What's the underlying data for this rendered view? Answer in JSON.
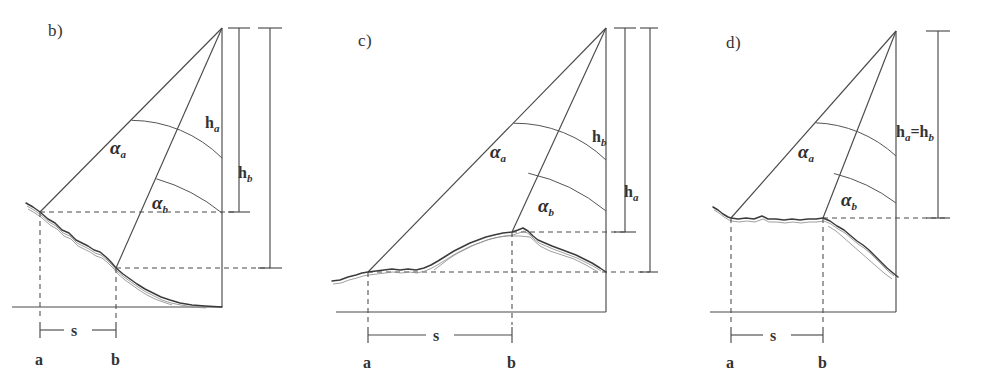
{
  "figure": {
    "background_color": "#ffffff",
    "ink_color": "#4a4a4a",
    "terrain_color": "#3b3b3b"
  },
  "panels": [
    {
      "id": "b",
      "label": "b)",
      "terrain_description": "ground surface descending from point a to the right, below both stations",
      "apex_description": "observation target at top right",
      "angles": [
        {
          "name": "alpha-a",
          "symbol": "α",
          "subscript": "a"
        },
        {
          "name": "alpha-b",
          "symbol": "β-as-alpha",
          "subscript": "b"
        }
      ],
      "heights": [
        {
          "name": "h-a",
          "symbol": "h",
          "subscript": "a",
          "position": "inner"
        },
        {
          "name": "h-b",
          "symbol": "h",
          "subscript": "b",
          "position": "outer"
        }
      ],
      "baseline": {
        "symbol": "s",
        "from": "a",
        "to": "b"
      },
      "points": [
        {
          "name": "point-a",
          "label": "a"
        },
        {
          "name": "point-b",
          "label": "b"
        }
      ]
    },
    {
      "id": "c",
      "label": "c)",
      "terrain_description": "ground surface rising from left to a crest at point b then descending",
      "apex_description": "observation target at top right",
      "angles": [
        {
          "name": "alpha-a",
          "symbol": "α",
          "subscript": "a"
        },
        {
          "name": "alpha-b",
          "symbol": "α",
          "subscript": "b"
        }
      ],
      "heights": [
        {
          "name": "h-b",
          "symbol": "h",
          "subscript": "b",
          "position": "inner"
        },
        {
          "name": "h-a",
          "symbol": "h",
          "subscript": "a",
          "position": "outer"
        }
      ],
      "baseline": {
        "symbol": "s",
        "from": "a",
        "to": "b"
      },
      "points": [
        {
          "name": "point-a",
          "label": "a"
        },
        {
          "name": "point-b",
          "label": "b"
        }
      ]
    },
    {
      "id": "d",
      "label": "d)",
      "terrain_description": "ground surface level between a and b then descending to the right",
      "apex_description": "observation target at top right",
      "angles": [
        {
          "name": "alpha-a",
          "symbol": "α",
          "subscript": "a"
        },
        {
          "name": "alpha-b",
          "symbol": "α",
          "subscript": "b"
        }
      ],
      "heights": [
        {
          "name": "h-a-equals-h-b",
          "symbol": "h",
          "subscript": "a",
          "equals": "=",
          "symbol2": "h",
          "subscript2": "b",
          "position": "single"
        }
      ],
      "baseline": {
        "symbol": "s",
        "from": "a",
        "to": "b"
      },
      "points": [
        {
          "name": "point-a",
          "label": "a"
        },
        {
          "name": "point-b",
          "label": "b"
        }
      ]
    }
  ]
}
